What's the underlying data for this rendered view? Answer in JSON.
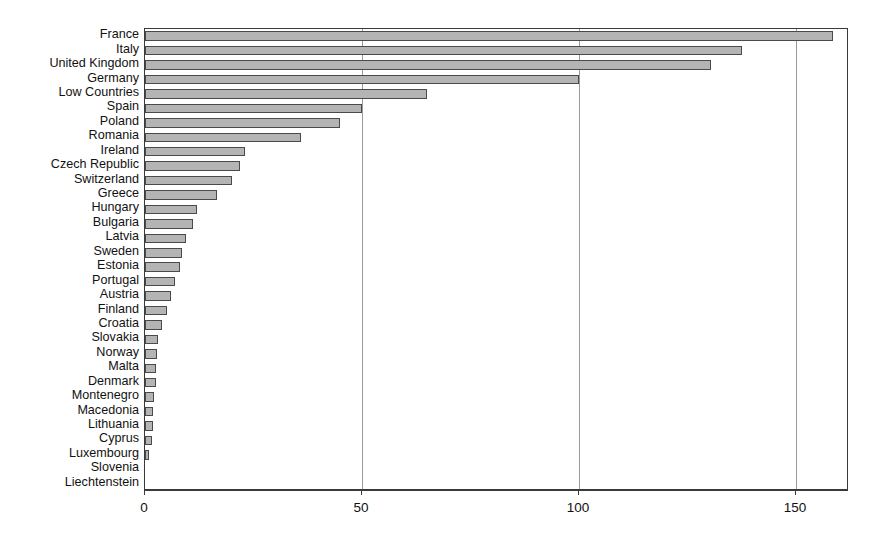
{
  "chart_data": {
    "type": "bar",
    "orientation": "horizontal",
    "title": "",
    "subtitle": "",
    "xlabel": "",
    "ylabel": "",
    "xlim": [
      0,
      162.2
    ],
    "xticks": [
      0,
      50,
      100,
      150
    ],
    "xticklabels": [
      "0",
      "50",
      "100",
      "150"
    ],
    "grid": "vertical",
    "legend": "none",
    "bar_color": "#b4b4b4",
    "bar_edge_color": "#4a4a4a",
    "axis_color": "#3a3a3a",
    "gridline_color": "#9a9a9a",
    "categories": [
      "France",
      "Italy",
      "United Kingdom",
      "Germany",
      "Low Countries",
      "Spain",
      "Poland",
      "Romania",
      "Ireland",
      "Czech Republic",
      "Switzerland",
      "Greece",
      "Hungary",
      "Bulgaria",
      "Latvia",
      "Sweden",
      "Estonia",
      "Portugal",
      "Austria",
      "Finland",
      "Croatia",
      "Slovakia",
      "Norway",
      "Malta",
      "Denmark",
      "Montenegro",
      "Macedonia",
      "Lithuania",
      "Cyprus",
      "Luxembourg",
      "Slovenia",
      "Liechtenstein"
    ],
    "values": [
      158.5,
      137.5,
      130.5,
      100.0,
      65.0,
      50.0,
      45.0,
      36.0,
      23.0,
      22.0,
      20.0,
      16.5,
      12.0,
      11.0,
      9.5,
      8.5,
      8.0,
      7.0,
      6.0,
      5.0,
      4.0,
      3.0,
      2.8,
      2.6,
      2.5,
      2.0,
      1.9,
      1.8,
      1.7,
      1.0,
      0.0,
      0.0
    ]
  }
}
